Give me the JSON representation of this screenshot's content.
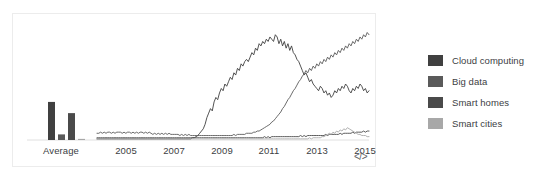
{
  "legend": {
    "position": "right",
    "items": [
      {
        "label": "Cloud computing",
        "color": "#404040"
      },
      {
        "label": "Big data",
        "color": "#5a5a5a"
      },
      {
        "label": "Smart homes",
        "color": "#4a4a4a"
      },
      {
        "label": "Smart cities",
        "color": "#a8a8a8"
      }
    ]
  },
  "axis": {
    "ticks": [
      {
        "label": "Average",
        "x": 48
      },
      {
        "label": "2005",
        "x": 113
      },
      {
        "label": "2007",
        "x": 161
      },
      {
        "label": "2009",
        "x": 209
      },
      {
        "label": "2011",
        "x": 256
      },
      {
        "label": "2013",
        "x": 304
      },
      {
        "label": "2015",
        "x": 352
      }
    ]
  },
  "embed": {
    "icon": "code-embed-icon",
    "label": "</>"
  },
  "chart_data": {
    "type": "line",
    "title": "",
    "xlabel": "",
    "ylabel": "",
    "grid": false,
    "ylim": [
      0,
      100
    ],
    "x_tick_labels": [
      "Average",
      "2005",
      "2007",
      "2009",
      "2011",
      "2013",
      "2015"
    ],
    "average_bars": {
      "type": "bar",
      "categories": [
        "Cloud computing",
        "Big data",
        "Smart homes",
        "Smart cities"
      ],
      "values": [
        34,
        5,
        24,
        1
      ],
      "colors": [
        "#404040",
        "#5a5a5a",
        "#4a4a4a",
        "#a8a8a8"
      ]
    },
    "x_range": [
      "2004-01",
      "2016-08"
    ],
    "series": [
      {
        "name": "Cloud computing",
        "color": "#404040",
        "values": [
          1,
          1,
          1,
          1,
          1,
          1,
          1,
          1,
          1,
          1,
          1,
          1,
          1,
          1,
          1,
          1,
          1,
          1,
          1,
          1,
          1,
          1,
          1,
          1,
          1,
          1,
          1,
          1,
          1,
          1,
          1,
          1,
          1,
          1,
          1,
          1,
          1,
          1,
          1,
          1,
          1,
          1,
          1,
          1,
          1,
          1,
          1,
          1,
          1,
          1,
          1,
          1,
          1,
          2,
          2,
          3,
          4,
          6,
          8,
          10,
          14,
          20,
          24,
          28,
          26,
          34,
          38,
          36,
          42,
          46,
          44,
          50,
          48,
          52,
          56,
          54,
          60,
          58,
          64,
          62,
          68,
          66,
          70,
          72,
          70,
          74,
          78,
          76,
          82,
          80,
          86,
          84,
          88,
          86,
          90,
          88,
          92,
          90,
          88,
          94,
          92,
          86,
          90,
          84,
          88,
          82,
          86,
          80,
          84,
          78,
          76,
          72,
          70,
          66,
          62,
          58,
          60,
          56,
          52,
          54,
          50,
          48,
          46,
          44,
          48,
          46,
          42,
          44,
          40,
          42,
          38,
          40,
          44,
          42,
          46,
          44,
          48,
          46,
          50,
          48,
          44,
          42,
          46,
          44,
          48,
          46,
          50,
          48,
          44,
          46,
          42,
          44
        ]
      },
      {
        "name": "Big data",
        "color": "#5a5a5a",
        "values": [
          6,
          6,
          7,
          6,
          7,
          6,
          7,
          7,
          6,
          7,
          6,
          7,
          7,
          7,
          6,
          7,
          6,
          7,
          7,
          6,
          7,
          6,
          7,
          6,
          7,
          7,
          6,
          7,
          6,
          7,
          6,
          5,
          6,
          5,
          6,
          5,
          6,
          5,
          6,
          5,
          6,
          5,
          5,
          5,
          5,
          5,
          4,
          5,
          4,
          5,
          4,
          5,
          4,
          4,
          4,
          4,
          4,
          4,
          4,
          4,
          4,
          4,
          4,
          4,
          4,
          4,
          4,
          4,
          4,
          4,
          4,
          4,
          4,
          4,
          4,
          4,
          5,
          4,
          5,
          5,
          5,
          5,
          5,
          6,
          6,
          6,
          6,
          7,
          7,
          8,
          8,
          9,
          10,
          11,
          12,
          13,
          14,
          16,
          17,
          19,
          21,
          23,
          25,
          28,
          30,
          33,
          36,
          38,
          41,
          44,
          46,
          49,
          52,
          54,
          57,
          59,
          62,
          60,
          64,
          62,
          66,
          64,
          68,
          66,
          70,
          68,
          72,
          70,
          74,
          72,
          76,
          74,
          78,
          76,
          80,
          78,
          82,
          80,
          84,
          82,
          86,
          84,
          88,
          86,
          90,
          88,
          92,
          90,
          94,
          92,
          96,
          94
        ]
      },
      {
        "name": "Smart homes",
        "color": "#4a4a4a",
        "values": [
          2,
          2,
          2,
          2,
          2,
          2,
          2,
          2,
          2,
          2,
          2,
          2,
          2,
          2,
          2,
          2,
          2,
          2,
          2,
          2,
          2,
          2,
          2,
          2,
          2,
          2,
          2,
          2,
          2,
          2,
          2,
          2,
          2,
          2,
          2,
          2,
          2,
          2,
          2,
          2,
          2,
          2,
          2,
          2,
          2,
          2,
          2,
          2,
          2,
          2,
          2,
          2,
          2,
          2,
          2,
          2,
          2,
          2,
          2,
          2,
          2,
          2,
          2,
          2,
          2,
          2,
          2,
          2,
          2,
          2,
          2,
          2,
          2,
          2,
          2,
          2,
          2,
          2,
          2,
          2,
          2,
          2,
          2,
          2,
          2,
          2,
          2,
          2,
          2,
          2,
          2,
          2,
          2,
          3,
          2,
          3,
          2,
          3,
          3,
          3,
          3,
          3,
          3,
          3,
          3,
          3,
          3,
          3,
          3,
          3,
          3,
          3,
          3,
          4,
          3,
          4,
          3,
          4,
          4,
          4,
          4,
          4,
          4,
          4,
          4,
          4,
          4,
          5,
          4,
          5,
          5,
          5,
          5,
          5,
          5,
          6,
          5,
          6,
          6,
          6,
          6,
          6,
          7,
          6,
          7,
          7,
          7,
          7,
          8,
          7,
          8,
          8
        ]
      },
      {
        "name": "Smart cities",
        "color": "#a8a8a8",
        "values": [
          1,
          1,
          1,
          1,
          1,
          1,
          1,
          1,
          1,
          1,
          1,
          1,
          1,
          1,
          1,
          1,
          1,
          1,
          1,
          1,
          1,
          1,
          1,
          1,
          1,
          1,
          1,
          1,
          1,
          1,
          1,
          1,
          1,
          1,
          1,
          1,
          1,
          1,
          1,
          1,
          1,
          1,
          1,
          1,
          1,
          1,
          1,
          1,
          1,
          1,
          1,
          1,
          1,
          1,
          1,
          1,
          1,
          1,
          1,
          1,
          1,
          1,
          1,
          1,
          1,
          1,
          1,
          1,
          1,
          1,
          1,
          1,
          1,
          1,
          1,
          1,
          1,
          1,
          1,
          1,
          1,
          1,
          1,
          1,
          1,
          1,
          1,
          1,
          1,
          1,
          1,
          1,
          1,
          1,
          1,
          1,
          1,
          1,
          1,
          1,
          1,
          1,
          1,
          1,
          1,
          1,
          1,
          1,
          1,
          1,
          1,
          1,
          1,
          1,
          1,
          1,
          1,
          1,
          2,
          1,
          2,
          2,
          2,
          2,
          2,
          3,
          3,
          4,
          5,
          6,
          5,
          7,
          6,
          8,
          7,
          9,
          8,
          10,
          9,
          11,
          10,
          9,
          8,
          7,
          6,
          5,
          5,
          4,
          4,
          4,
          3,
          3
        ]
      }
    ]
  }
}
